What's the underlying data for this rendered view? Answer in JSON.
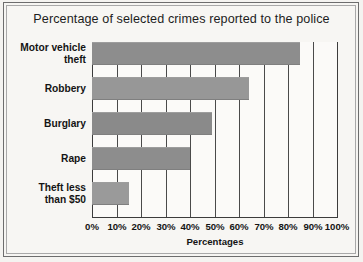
{
  "chart_data": {
    "type": "bar",
    "orientation": "horizontal",
    "title": "Percentage of selected crimes reported to the police",
    "xlabel": "Percentages",
    "ylabel": "",
    "xlim": [
      0,
      100
    ],
    "grid": true,
    "legend": null,
    "categories": [
      "Motor vehicle theft",
      "Robbery",
      "Burglary",
      "Rape",
      "Theft less than $50"
    ],
    "category_lines": [
      [
        "Motor vehicle",
        "theft"
      ],
      [
        "Robbery"
      ],
      [
        "Burglary"
      ],
      [
        "Rape"
      ],
      [
        "Theft less",
        "than $50"
      ]
    ],
    "values": [
      85,
      64,
      49,
      40,
      15
    ],
    "tick_labels": [
      "0%",
      "10%",
      "20%",
      "30%",
      "40%",
      "50%",
      "60%",
      "70%",
      "80%",
      "90%",
      "100%"
    ],
    "tick_values": [
      0,
      10,
      20,
      30,
      40,
      50,
      60,
      70,
      80,
      90,
      100
    ],
    "bar_color": "#8f8f8f",
    "axis_color": "#3c3c3c",
    "background_color": "#f7f6f3"
  }
}
